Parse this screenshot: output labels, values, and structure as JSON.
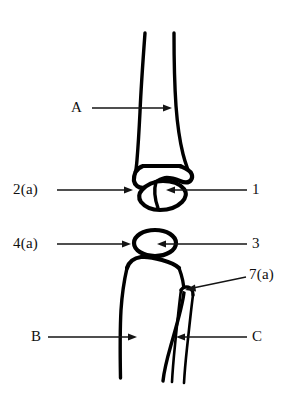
{
  "figure": {
    "background_color": "#ffffff",
    "ink_color": "#000000",
    "labels": [
      {
        "id": "A",
        "text": "A",
        "x": 78,
        "y": 108,
        "arrow": "points right into upper bone shaft"
      },
      {
        "id": "2a",
        "text": "2(a)",
        "x": 30,
        "y": 190,
        "arrow": "points right to lower end of upper bone"
      },
      {
        "id": "1",
        "text": "1",
        "x": 255,
        "y": 190,
        "arrow": "points left into small bone below upper bone"
      },
      {
        "id": "4a",
        "text": "4(a)",
        "x": 30,
        "y": 244,
        "arrow": "points right to top of lower bone"
      },
      {
        "id": "3",
        "text": "3",
        "x": 255,
        "y": 244,
        "arrow": "points left into oval bone"
      },
      {
        "id": "7a",
        "text": "7(a)",
        "x": 262,
        "y": 275,
        "arrow": "diagonal, points down-left to head of thin side bone"
      },
      {
        "id": "B",
        "text": "B",
        "x": 36,
        "y": 337,
        "arrow": "points right into main lower shaft"
      },
      {
        "id": "C",
        "text": "C",
        "x": 255,
        "y": 337,
        "arrow": "points left into thin side bone shaft"
      }
    ],
    "structures": [
      {
        "name": "upper-bone-shaft",
        "described_by": [
          "A"
        ]
      },
      {
        "name": "upper-bone-distal-end",
        "described_by": [
          "2(a)"
        ]
      },
      {
        "name": "small-joint-bone",
        "described_by": [
          "1"
        ]
      },
      {
        "name": "oval-bone",
        "described_by": [
          "3"
        ]
      },
      {
        "name": "lower-bone-proximal-end",
        "described_by": [
          "4(a)"
        ]
      },
      {
        "name": "lower-bone-shaft",
        "described_by": [
          "B"
        ]
      },
      {
        "name": "thin-side-bone-head",
        "described_by": [
          "7(a)"
        ]
      },
      {
        "name": "thin-side-bone-shaft",
        "described_by": [
          "C"
        ]
      }
    ]
  }
}
